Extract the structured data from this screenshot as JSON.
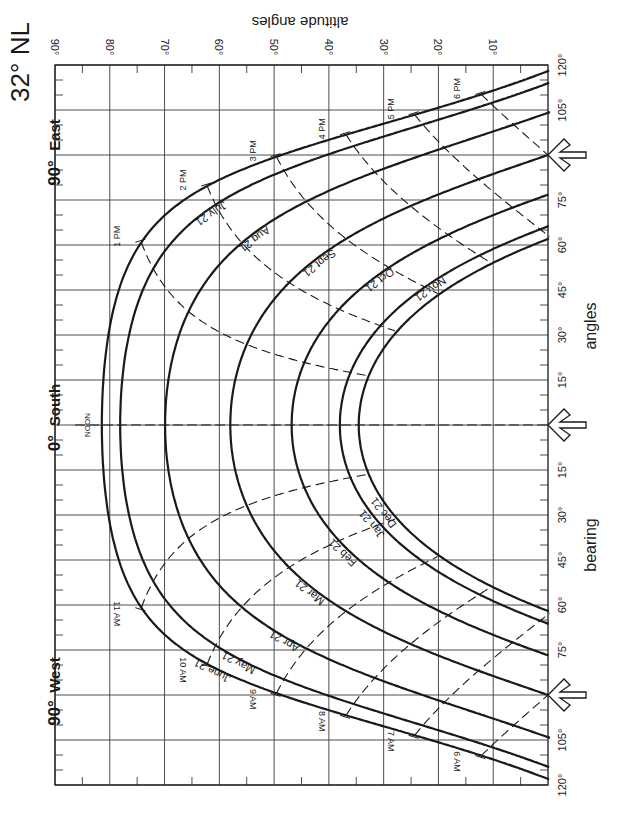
{
  "chart_data": {
    "type": "line",
    "title": "32° NL",
    "subtitle": "Sun path diagram (rectangular projection)",
    "xlabel": "bearing angles",
    "ylabel": "altitude angles",
    "latitude_deg": 32,
    "orientation": "rotated 90° clockwise: bearing runs along page vertical, altitude along page horizontal",
    "altitude_axis": {
      "ticks": [
        90,
        80,
        70,
        60,
        50,
        40,
        30,
        20,
        10
      ],
      "tick_labels": [
        "90°",
        "80°",
        "70°",
        "60°",
        "50°",
        "40°",
        "30°",
        "20°",
        "10°"
      ],
      "range": [
        0,
        90
      ]
    },
    "bearing_axis": {
      "ticks": [
        -120,
        -105,
        -90,
        -75,
        -60,
        -45,
        -30,
        -15,
        0,
        15,
        30,
        45,
        60,
        75,
        90,
        105,
        120
      ],
      "tick_labels": [
        "120°",
        "105°",
        "90°",
        "75°",
        "60°",
        "45°",
        "30°",
        "15°",
        "0°",
        "15°",
        "30°",
        "45°",
        "60°",
        "75°",
        "90°",
        "105°",
        "120°"
      ],
      "range": [
        -120,
        120
      ],
      "direction_markers": [
        {
          "label": "90° West",
          "deg": "90°",
          "dir": "West",
          "bearing": -90
        },
        {
          "label": "0° South",
          "deg": "0°",
          "dir": "South",
          "bearing": 0
        },
        {
          "label": "90° East",
          "deg": "90°",
          "dir": "East",
          "bearing": 90
        }
      ]
    },
    "grid": true,
    "series": [
      {
        "name": "June 21",
        "declination": 23.45,
        "noon_altitude": 81.5
      },
      {
        "name": "May 21 / July 21",
        "declination": 20.1,
        "noon_altitude": 78.1
      },
      {
        "name": "Apr 21 / Aug 21",
        "declination": 11.9,
        "noon_altitude": 69.9
      },
      {
        "name": "Mar 21 / Sept 21",
        "declination": 0.0,
        "noon_altitude": 58.0
      },
      {
        "name": "Feb 21 / Oct 21",
        "declination": -11.2,
        "noon_altitude": 46.8
      },
      {
        "name": "Jan 21 / Nov 21",
        "declination": -20.0,
        "noon_altitude": 38.0
      },
      {
        "name": "Dec 21",
        "declination": -23.45,
        "noon_altitude": 34.6
      }
    ],
    "date_labels": {
      "afternoon": [
        "July 21",
        "Aug 21",
        "Sept 21",
        "Oct 21",
        "Nov 21"
      ],
      "morning": [
        "June 21",
        "May 21",
        "Apr 21",
        "Mar 21",
        "Feb 21",
        "Jan 21",
        "Dec 21"
      ]
    },
    "hour_lines": [
      {
        "label": "6 AM",
        "hour": -6
      },
      {
        "label": "7 AM",
        "hour": -5
      },
      {
        "label": "8 AM",
        "hour": -4
      },
      {
        "label": "9 AM",
        "hour": -3
      },
      {
        "label": "10 AM",
        "hour": -2
      },
      {
        "label": "11 AM",
        "hour": -1
      },
      {
        "label": "NOON",
        "hour": 0
      },
      {
        "label": "1 PM",
        "hour": 1
      },
      {
        "label": "2 PM",
        "hour": 2
      },
      {
        "label": "3 PM",
        "hour": 3
      },
      {
        "label": "4 PM",
        "hour": 4
      },
      {
        "label": "5 PM",
        "hour": 5
      },
      {
        "label": "6 PM",
        "hour": 6
      }
    ]
  },
  "colors": {
    "ink": "#1a1a1a",
    "grid": "#3a3a3a",
    "background": "#ffffff"
  }
}
